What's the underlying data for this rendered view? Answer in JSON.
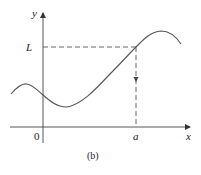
{
  "figure": {
    "caption": "(b)",
    "labels": {
      "y_axis": "y",
      "x_axis": "x",
      "origin": "0",
      "limit_value": "L",
      "point_a": "a"
    },
    "colors": {
      "curve": "#555555",
      "axes": "#444444",
      "dashed": "#555555",
      "text": "#222222"
    }
  }
}
